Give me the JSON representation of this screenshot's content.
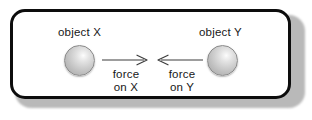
{
  "figure": {
    "background_color": "#ffffff",
    "frame": {
      "border_color": "#0d0d0d",
      "fill_color": "#ffffff",
      "shadow_color": "#b9b9b9"
    },
    "objects": [
      {
        "id": "object-x",
        "label": "object X",
        "icon": "sphere-icon",
        "color": "#cfcfcf"
      },
      {
        "id": "object-y",
        "label": "object Y",
        "icon": "sphere-icon",
        "color": "#cfcfcf"
      }
    ],
    "forces": [
      {
        "id": "force-on-x",
        "label_line1": "force",
        "label_line2": "on X",
        "icon": "arrow-right-icon",
        "direction": "right",
        "color": "#3c3c3c"
      },
      {
        "id": "force-on-y",
        "label_line1": "force",
        "label_line2": "on Y",
        "icon": "arrow-left-icon",
        "direction": "left",
        "color": "#3c3c3c"
      }
    ]
  }
}
